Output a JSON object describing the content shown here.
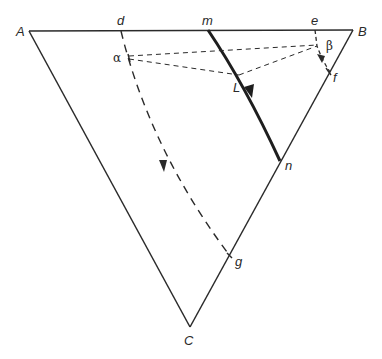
{
  "diagram": {
    "type": "ternary-phase-diagram",
    "vertices": [
      {
        "id": "A",
        "label": "A",
        "x": 29,
        "y": 31
      },
      {
        "id": "B",
        "label": "B",
        "x": 353,
        "y": 30
      },
      {
        "id": "C",
        "label": "C",
        "x": 190,
        "y": 327
      }
    ],
    "points": [
      {
        "id": "d",
        "label": "d",
        "x": 121,
        "y": 31
      },
      {
        "id": "m",
        "label": "m",
        "x": 208,
        "y": 30
      },
      {
        "id": "e",
        "label": "e",
        "x": 315,
        "y": 30
      },
      {
        "id": "alpha",
        "label": "α",
        "x": 129,
        "y": 57
      },
      {
        "id": "beta",
        "label": "β",
        "x": 318,
        "y": 46
      },
      {
        "id": "L",
        "label": "L",
        "x": 239,
        "y": 75
      },
      {
        "id": "f",
        "label": "f",
        "x": 330,
        "y": 72
      },
      {
        "id": "n",
        "label": "n",
        "x": 280,
        "y": 161
      },
      {
        "id": "g",
        "label": "g",
        "x": 230,
        "y": 256
      }
    ],
    "curves": [
      {
        "id": "d-g",
        "from": "d",
        "to": "g",
        "style": "dashed",
        "arrow": "mid-down"
      },
      {
        "id": "m-n",
        "from": "m",
        "to": "n",
        "style": "bold-solid",
        "arrow": "mid-down"
      },
      {
        "id": "e-f",
        "from": "e",
        "to": "f",
        "style": "dashed",
        "arrow": "down"
      }
    ],
    "tie_lines": [
      {
        "from": "alpha",
        "to": "beta",
        "style": "dashed"
      },
      {
        "from": "alpha",
        "to": "L",
        "style": "dashed"
      },
      {
        "from": "L",
        "to": "beta",
        "style": "dashed"
      }
    ],
    "colors": {
      "line": "#2a2a2a",
      "background": "#ffffff"
    }
  }
}
